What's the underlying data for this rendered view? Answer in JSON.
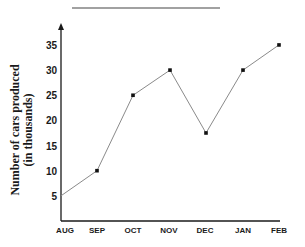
{
  "chart_data": {
    "type": "line",
    "title": "",
    "xlabel": "",
    "ylabel": "Number of cars produced (in thousands)",
    "ylabel_lines": [
      "Number of cars produced",
      "(in thousands)"
    ],
    "categories": [
      "AUG",
      "SEP",
      "OCT",
      "NOV",
      "DEC",
      "JAN",
      "FEB"
    ],
    "values": [
      5,
      10,
      25,
      30,
      17.5,
      30,
      35
    ],
    "yticks": [
      5,
      10,
      15,
      20,
      25,
      30,
      35
    ],
    "ylim": [
      0,
      39
    ],
    "grid": false,
    "legend": null,
    "markers": [
      false,
      true,
      true,
      true,
      true,
      true,
      true
    ]
  },
  "colors": {
    "axis": "#1a1a1a",
    "line": "#8a8a8a",
    "marker": "#111111",
    "title_rule": "#444444"
  }
}
